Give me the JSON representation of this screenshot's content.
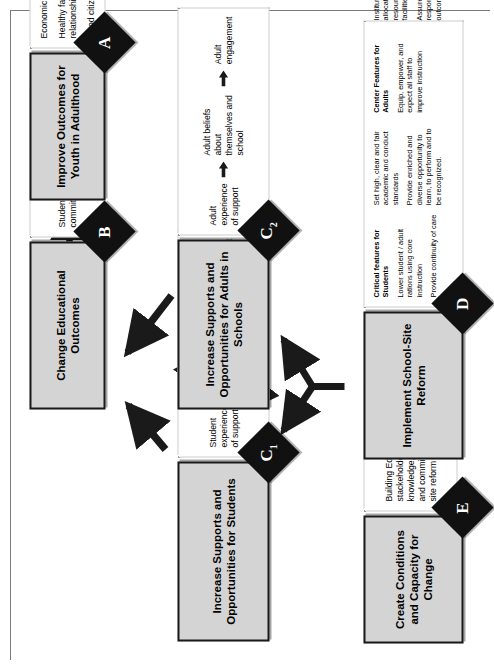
{
  "diagram": {
    "orientation": "rotated-90-clockwise",
    "colors": {
      "title_box_fill": "#d4d4d4",
      "title_box_border": "#1a1a1a",
      "diamond_fill": "#111111",
      "detail_border": "#9a9a9a",
      "arrow": "#1a1a1a"
    },
    "nodes": {
      "A": {
        "letter": "A",
        "title": "Improve Outcomes for Youth in Adulthood",
        "items": [
          "Economic self-sufficiency",
          "Healthy family and social relationships",
          "Good citizenship practices"
        ]
      },
      "B": {
        "letter": "B",
        "title": "Change Educational Outcomes",
        "items": [
          "Student performance and commitment"
        ]
      },
      "C1": {
        "letter": "C",
        "subscript": "1",
        "title": "Increase Supports and Opportunities for Students",
        "chain": [
          "Student experience of support",
          "Student beliefs about themselves and school",
          "Student engagement"
        ]
      },
      "C2": {
        "letter": "C",
        "subscript": "2",
        "title": "Increase Supports and Opportunities for Adults in Schools",
        "chain": [
          "Adult experience of support",
          "Adult beliefs about themselves and school",
          "Adult engagement"
        ]
      },
      "D": {
        "letter": "D",
        "title": "Implement School-Site Reform",
        "students_heading": "Critical features for Students",
        "students_items": [
          "Lower student / adult rations using core instruction",
          "Provide continuity of care",
          "Set high, clear and fair academic and conduct standards",
          "Provide enriched and diverse opportunity to learn, to perform and to be recognized."
        ],
        "adults_heading": "Center Features for Adults",
        "adults_items": [
          "Equip, empower, and expect all staff to improve instruction",
          "Institute flexible allocation of available resources: people, facilities, time and money",
          "Assure collective responsibility for student outcomes"
        ]
      },
      "E": {
        "letter": "E",
        "title": "Create Conditions and Capacity for Change",
        "items": [
          "Building Education stackeholders' awareness, knowledge, engagement and commitment to school-site reform"
        ]
      }
    },
    "connections": [
      {
        "from": "E",
        "to": "D",
        "style": "straight-arrow"
      },
      {
        "from": "D",
        "to": "C1",
        "style": "forked-arrow"
      },
      {
        "from": "D",
        "to": "C2",
        "style": "forked-arrow"
      },
      {
        "from": "C1",
        "to": "C2",
        "style": "curved-double-arrow"
      },
      {
        "from": "C1",
        "to": "B",
        "style": "diagonal-arrow"
      },
      {
        "from": "C2",
        "to": "B",
        "style": "diagonal-arrow"
      },
      {
        "from": "B",
        "to": "A",
        "style": "straight-arrow"
      }
    ]
  }
}
